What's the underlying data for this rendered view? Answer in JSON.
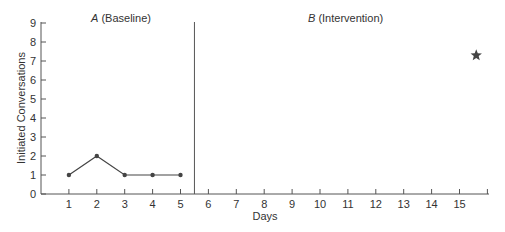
{
  "chart_data": {
    "type": "line",
    "title": "",
    "xlabel": "Days",
    "ylabel": "Initiated Conversations",
    "xlim": [
      0,
      16
    ],
    "ylim": [
      0,
      9
    ],
    "x_ticks": [
      1,
      2,
      3,
      4,
      5,
      6,
      7,
      8,
      9,
      10,
      11,
      12,
      13,
      14,
      15
    ],
    "y_ticks": [
      0,
      1,
      2,
      3,
      4,
      5,
      6,
      7,
      8,
      9
    ],
    "grid": false,
    "phases": [
      {
        "label_letter": "A",
        "label_text": " (Baseline)",
        "x_start": 0.5,
        "x_end": 5.5
      },
      {
        "label_letter": "B",
        "label_text": " (Intervention)",
        "x_start": 5.5,
        "x_end": 16
      }
    ],
    "phase_change_line_x": 5.5,
    "series": [
      {
        "name": "Baseline",
        "x": [
          1,
          2,
          3,
          4,
          5
        ],
        "values": [
          1,
          2,
          1,
          1,
          1
        ],
        "marker": "circle"
      }
    ],
    "annotations": [
      {
        "type": "star",
        "x": 15.6,
        "y": 7.3
      }
    ],
    "colors": {
      "line": "#444444",
      "axis": "#555555",
      "text": "#333333"
    }
  }
}
